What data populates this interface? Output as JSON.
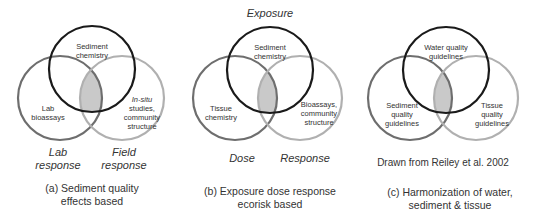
{
  "colors": {
    "top_circle": "#1a1a1a",
    "left_circle": "#6e6e6e",
    "right_circle": "#b0b0b0",
    "intersection_fill": "#c9c9c9"
  },
  "panels": [
    {
      "id": "a",
      "top_label": "",
      "circles": {
        "top": "Sediment chemistry",
        "left": "Lab bioassays",
        "right_italic": "In-situ",
        "right": "studies, community structure"
      },
      "bottom_labels": {
        "left": "Lab response",
        "right": "Field response"
      },
      "caption_line1": "(a) Sediment quality",
      "caption_line2": "effects based"
    },
    {
      "id": "b",
      "top_label": "Exposure",
      "circles": {
        "top": "Sediment chemistry",
        "left": "Tissue chemistry",
        "right": "Bioassays, community structure"
      },
      "bottom_labels": {
        "left": "Dose",
        "right": "Response"
      },
      "caption_line1": "(b) Exposure dose response",
      "caption_line2": "ecorisk based"
    },
    {
      "id": "c",
      "top_label": "",
      "circles": {
        "top": "Water quality guidelines",
        "left": "Sediment quality guidelines",
        "right": "Tissue quality guidelines"
      },
      "source_note": "Drawn from Reiley et al. 2002",
      "caption_line1": "(c)  Harmonization of water,",
      "caption_line2": "sediment & tissue"
    }
  ]
}
